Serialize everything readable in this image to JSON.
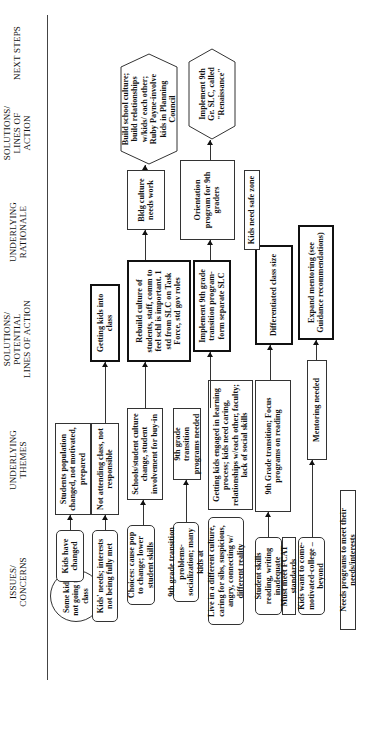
{
  "headers": {
    "issues": "ISSUES/ CONCERNS",
    "themes": "UNDERLYING THEMES",
    "potential_solutions": "SOLUTIONS/ POTENTIAL LINES OF ACTION",
    "rationale": "UNDERLYING RATIONALE",
    "solutions": "SOLUTIONS/ LINES OF ACTION",
    "next_steps": "NEXT STEPS"
  },
  "issues": {
    "root": "Some kids not going to class",
    "items": [
      "Kids have changed",
      "Kids' needs; interests not being fully met",
      "Choices: cause pop to change; lower student skills",
      "9th grade transition problems-socialization; many kids at",
      "Live in a different culture, caring for sibs, suspicious, angry, connecting w/ different reality",
      "Student skills reading, writing inadequate",
      "Must meet FCAT standards",
      "Kids want to come-motivated-college – beyond",
      "Needs programs to meet their needs/interests"
    ]
  },
  "themes": [
    "Students population changed, not motivated, prepared",
    "Not attending class, not responsible",
    "Schools/student culture change, student involvement for buy-in",
    "9th grade transition programs needed",
    "Getting kids engaged in learning process; kids need caring, relationships w/each other, faculty; lack of social skills",
    "9th Grade transition; Focus programs on reading",
    "Mentoring needed"
  ],
  "potential_solutions": [
    "Getting kids into class",
    "Rebuild culture of students, staff, comm to feel schl is important. 1 std from SLC on Task Force, std gov roles",
    "Implement 9th grade transition program-form separate SLC",
    "Differentiated class size",
    "Expand mentoring (see Guidance recommendations)"
  ],
  "rationale": [
    "Bldg culture needs work",
    "Orientation program for 9th graders",
    "Kids need safe zone"
  ],
  "solutions": [
    "Build school culture; build relationships w/kids/ each other; Ruby Payne-involve kids in Planning Council",
    "Implement 9th Gr. SLC, called \"Renaissance\""
  ]
}
